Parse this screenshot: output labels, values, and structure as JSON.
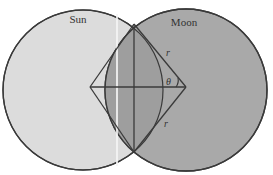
{
  "figure": {
    "labels": {
      "sun": "Sun",
      "moon": "Moon",
      "radius_upper": "r",
      "radius_lower": "r",
      "angle": "θ"
    },
    "colors": {
      "sun_fill": "#dcdcdc",
      "moon_fill": "#a9a9a9",
      "overlap_fill": "#9c9c9c",
      "stroke": "#3a3a3a",
      "background": "#ffffff"
    },
    "geometry": {
      "sun_center": [
        83,
        90
      ],
      "sun_radius": 80,
      "moon_center": [
        186,
        90
      ],
      "moon_radius": 81,
      "intersection_top": [
        134,
        24
      ],
      "intersection_bottom": [
        134,
        152
      ],
      "left_vertex": [
        90,
        87
      ]
    }
  }
}
